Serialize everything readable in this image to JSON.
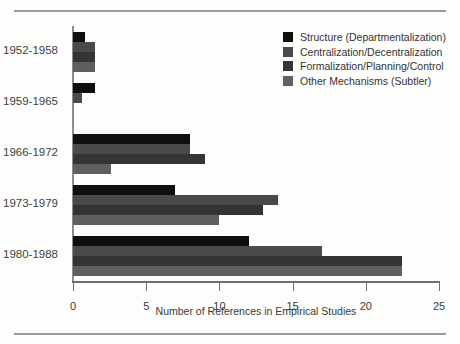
{
  "chart_data": {
    "type": "bar",
    "orientation": "horizontal",
    "title": "",
    "xlabel": "Number of References in Empirical Studies",
    "ylabel": "",
    "xlim": [
      0,
      25
    ],
    "xticks": [
      0,
      5,
      10,
      15,
      20,
      25
    ],
    "grid": false,
    "legend_position": "top-right",
    "categories": [
      "1952-1958",
      "1959-1965",
      "1966-1972",
      "1973-1979",
      "1980-1988"
    ],
    "series": [
      {
        "name": "Structure (Departmentalization)",
        "color": "#100f0f",
        "values": [
          0.8,
          1.5,
          8,
          7,
          12
        ]
      },
      {
        "name": "Centralization/Decentralization",
        "color": "#4a4a4a",
        "values": [
          1.5,
          0.6,
          8,
          14,
          17
        ]
      },
      {
        "name": "Formalization/Planning/Control",
        "color": "#343434",
        "values": [
          1.5,
          0,
          9,
          13,
          22.5
        ]
      },
      {
        "name": "Other Mechanisms (Subtler)",
        "color": "#5f5f5f",
        "values": [
          1.5,
          0,
          2.6,
          10,
          22.5
        ]
      }
    ]
  },
  "axis": {
    "x_title": "Number of References in Empirical Studies",
    "tick_labels": [
      "0",
      "5",
      "10",
      "15",
      "20",
      "25"
    ]
  },
  "legend": {
    "items": [
      {
        "label": "Structure (Departmentalization)",
        "color": "#100f0f"
      },
      {
        "label": "Centralization/Decentralization",
        "color": "#4a4a4a"
      },
      {
        "label": "Formalization/Planning/Control",
        "color": "#343434"
      },
      {
        "label": "Other Mechanisms (Subtler)",
        "color": "#5f5f5f"
      }
    ]
  }
}
